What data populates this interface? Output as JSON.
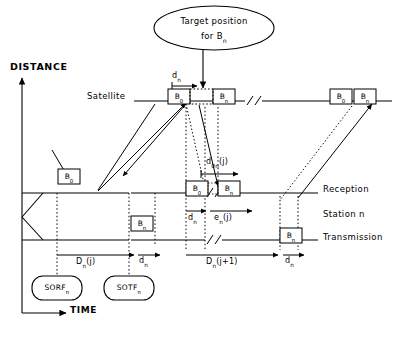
{
  "diagram": {
    "title_note": "Target position for Bn",
    "axes": {
      "y_label": "DISTANCE",
      "x_label": "TIME"
    },
    "timeline_labels": {
      "satellite": "Satellite",
      "reception": "Reception",
      "station": "Station n",
      "transmission": "Transmission"
    },
    "bubble": {
      "line1": "Target position",
      "line2_pre": "for B",
      "line2_sub": "n"
    },
    "burst_boxes": {
      "b0": {
        "base": "B",
        "sub": "0"
      },
      "bn": {
        "base": "B",
        "sub": "n"
      }
    },
    "nodes": [
      {
        "base": "SORF",
        "sub": "n"
      },
      {
        "base": "SOTF",
        "sub": "n"
      }
    ],
    "measures": {
      "dn_top": {
        "base": "d",
        "sub": "n",
        "arg": ""
      },
      "don_j": {
        "base": "d",
        "sub": "0n",
        "arg": "(j)"
      },
      "dn_recv": {
        "base": "d",
        "sub": "n",
        "arg": ""
      },
      "en_j": {
        "base": "e",
        "sub": "n",
        "arg": "(j)"
      },
      "Dn_j": {
        "base": "D",
        "sub": "n",
        "arg": "(j)"
      },
      "dn_mid": {
        "base": "d",
        "sub": "n",
        "arg": ""
      },
      "Dn_j1": {
        "base": "D",
        "sub": "n",
        "arg": "(j+1)"
      },
      "dn_right": {
        "base": "d",
        "sub": "n",
        "arg": ""
      }
    },
    "colors": {
      "stroke": "#000000",
      "background": "#ffffff",
      "dotted": "#000000"
    }
  }
}
